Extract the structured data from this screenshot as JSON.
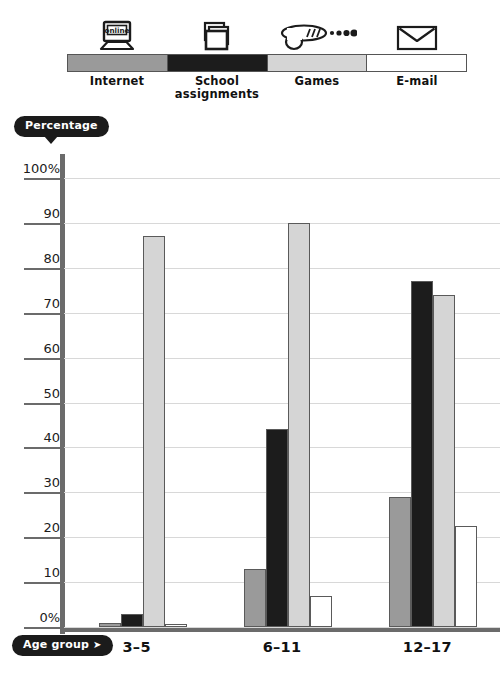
{
  "legend": {
    "items": [
      {
        "label": "Internet",
        "color": "#9a9a9a",
        "icon": "laptop-online-icon",
        "icon_text": "online"
      },
      {
        "label": "School\nassignments",
        "color": "#1c1c1c",
        "icon": "stacked-papers-icon",
        "icon_text": ""
      },
      {
        "label": "Games",
        "color": "#d5d5d5",
        "icon": "ray-gun-icon",
        "icon_text": ""
      },
      {
        "label": "E-mail",
        "color": "#ffffff",
        "icon": "envelope-icon",
        "icon_text": ""
      }
    ]
  },
  "axes": {
    "y_title": "Percentage",
    "x_title": "Age group",
    "x_title_arrow": "➤",
    "y_tick_labels": [
      "100%",
      "90",
      "80",
      "70",
      "60",
      "50",
      "40",
      "30",
      "20",
      "10",
      "0%"
    ],
    "y_tick_values": [
      100,
      90,
      80,
      70,
      60,
      50,
      40,
      30,
      20,
      10,
      0
    ]
  },
  "chart_data": {
    "type": "bar",
    "title": "",
    "xlabel": "Age group",
    "ylabel": "Percentage",
    "ylim": [
      0,
      100
    ],
    "grid": true,
    "legend_position": "top",
    "categories": [
      "3–5",
      "6–11",
      "12–17"
    ],
    "series": [
      {
        "name": "Internet",
        "color": "#9a9a9a",
        "values": [
          1,
          13,
          29
        ]
      },
      {
        "name": "School assignments",
        "color": "#1c1c1c",
        "values": [
          3,
          44,
          77
        ]
      },
      {
        "name": "Games",
        "color": "#d5d5d5",
        "values": [
          87,
          90,
          74
        ]
      },
      {
        "name": "E-mail",
        "color": "#ffffff",
        "values": [
          0.5,
          7,
          22.5
        ]
      }
    ]
  },
  "colors": {
    "axis": "#6b6b6b",
    "grid": "#d8d8d8",
    "pill_bg": "#1b1b1b",
    "pill_text": "#ffffff",
    "bar_border": "#5a5a5a",
    "text": "#111111"
  }
}
